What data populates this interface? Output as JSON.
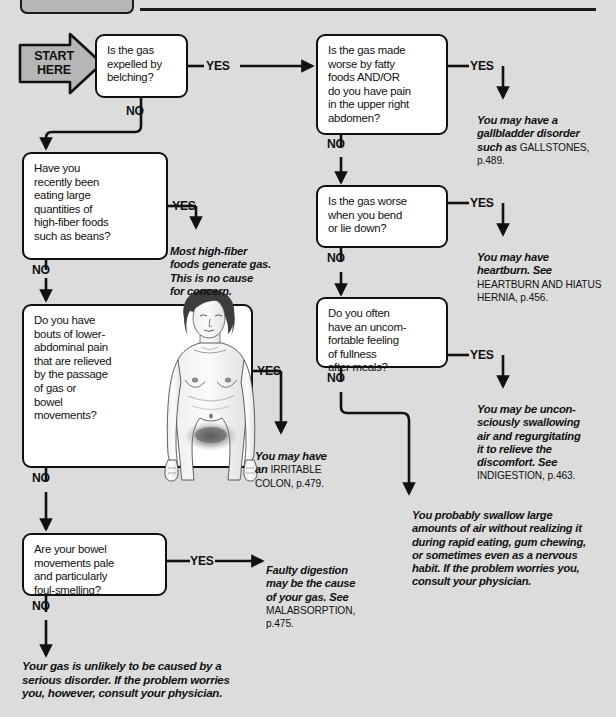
{
  "page": {
    "background_color": "#dcdcdc",
    "ink_color": "#111111",
    "header_box_color": "#b6b6b6"
  },
  "start": {
    "label": "START\nHERE",
    "shape": "arrow-pentagon"
  },
  "labels": {
    "yes": "YES",
    "no": "NO"
  },
  "questions": [
    {
      "id": "q-belching",
      "text": "Is the gas\nexpelled by\nbelching?"
    },
    {
      "id": "q-high-fiber",
      "text": "Have you\nrecently been\neating large\nquantities of\nhigh-fiber foods\nsuch as beans?"
    },
    {
      "id": "q-lower-abdominal",
      "text": "Do you have\nbouts of lower-\nabdominal pain\nthat are relieved\nby the passage\nof gas or\nbowel\nmovements?"
    },
    {
      "id": "q-bowel-pale",
      "text": "Are your bowel\nmovements pale\nand particularly\nfoul-smelling?"
    },
    {
      "id": "q-fatty-foods",
      "text": "Is the gas made\nworse by fatty\nfoods AND/OR\ndo you have pain\nin the upper right\nabdomen?"
    },
    {
      "id": "q-bend-lie-down",
      "text": "Is the gas worse\nwhen you bend\nor lie down?"
    },
    {
      "id": "q-fullness",
      "text": "Do you often\nhave an uncom-\nfortable feeling\nof fullness\nafter meals?"
    }
  ],
  "outcomes": [
    {
      "id": "out-high-fiber",
      "italic": "Most high-fiber\nfoods generate gas.\nThis is no cause\nfor concern.",
      "smallcaps": ""
    },
    {
      "id": "out-irritable-colon",
      "italic": "You may have\nan ",
      "smallcaps": "IRRITABLE\nCOLON, p.479."
    },
    {
      "id": "out-malabsorption",
      "italic": "Faulty digestion\nmay be the cause\nof your gas. See\n",
      "smallcaps": "MALABSORPTION,\np.475."
    },
    {
      "id": "out-gallstones",
      "italic": "You may have a\ngallbladder disorder\nsuch as ",
      "smallcaps": "GALLSTONES,\np.489."
    },
    {
      "id": "out-heartburn",
      "italic": "You may have\nheartburn. See\n",
      "smallcaps": "HEARTBURN AND HIATUS\nHERNIA, p.456."
    },
    {
      "id": "out-indigestion",
      "italic": "You may be uncon-\nsciously swallowing\nair and regurgitating\nit to relieve the\ndiscomfort. See\n",
      "smallcaps": "INDIGESTION, p.463."
    },
    {
      "id": "out-swallow-air",
      "italic": "You probably swallow large\namounts of air without realizing it\nduring rapid eating, gum chewing,\nor sometimes even as a nervous\nhabit. If the problem worries you,\nconsult your physician.",
      "smallcaps": ""
    }
  ],
  "final_conclusion": {
    "id": "final-no-serious-disorder",
    "text": "Your gas is unlikely to be caused by a\nserious disorder. If the problem worries\nyou, however, consult your physician."
  },
  "illustration": {
    "id": "female-torso-illustration",
    "description": "female figure with shaded lower abdomen"
  }
}
